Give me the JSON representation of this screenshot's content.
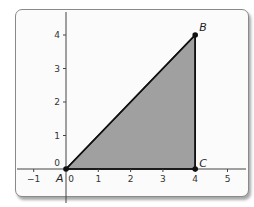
{
  "chart_data": {
    "type": "area",
    "title": "",
    "xlabel": "",
    "ylabel": "",
    "xlim": [
      -1.3,
      5.5
    ],
    "ylim": [
      -0.9,
      4.6
    ],
    "x_ticks": [
      -1,
      0,
      1,
      2,
      3,
      4,
      5
    ],
    "y_ticks": [
      0,
      1,
      2,
      3,
      4
    ],
    "grid": false,
    "shape": {
      "kind": "polygon",
      "name": "triangle ABC",
      "fill": "#a0a0a0",
      "stroke": "#111111",
      "vertices": [
        {
          "label": "A",
          "x": 0,
          "y": 0
        },
        {
          "label": "B",
          "x": 4,
          "y": 4
        },
        {
          "label": "C",
          "x": 4,
          "y": 0
        }
      ]
    }
  }
}
